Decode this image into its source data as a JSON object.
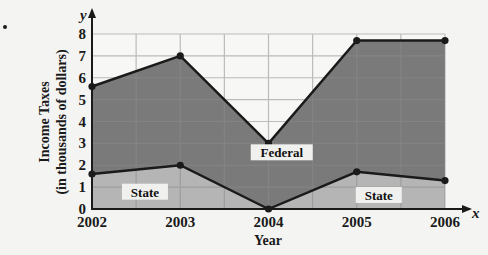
{
  "chart_data": {
    "type": "area",
    "title": "",
    "xlabel": "Year",
    "ylabel_line1": "Income Taxes",
    "ylabel_line2": "(in thousands of dollars)",
    "x_var": "x",
    "y_var": "y",
    "categories": [
      "2002",
      "2003",
      "2004",
      "2005",
      "2006"
    ],
    "x": [
      2002,
      2003,
      2004,
      2005,
      2006
    ],
    "yticks": [
      "0",
      "1",
      "2",
      "3",
      "4",
      "5",
      "6",
      "7",
      "8"
    ],
    "ylim": [
      0,
      8
    ],
    "grid": true,
    "series": [
      {
        "name": "Federal",
        "values": [
          5.6,
          7.0,
          3.0,
          7.7,
          7.7
        ],
        "color": "#7a7a7a"
      },
      {
        "name": "State",
        "values": [
          1.6,
          2.0,
          0.0,
          1.7,
          1.3
        ],
        "color": "#b5b5b5"
      }
    ],
    "annotations": [
      {
        "text": "Federal",
        "x": 2004.15,
        "y": 2.5
      },
      {
        "text": "State",
        "x": 2002.6,
        "y": 0.7
      },
      {
        "text": "State",
        "x": 2005.25,
        "y": 0.55
      }
    ],
    "legend": "none"
  },
  "colors": {
    "federal_fill": "#7a7a7a",
    "state_fill": "#b5b5b5",
    "line": "#1a1a1a",
    "grid": "#8c8c8c",
    "background": "#f4f4f2"
  }
}
